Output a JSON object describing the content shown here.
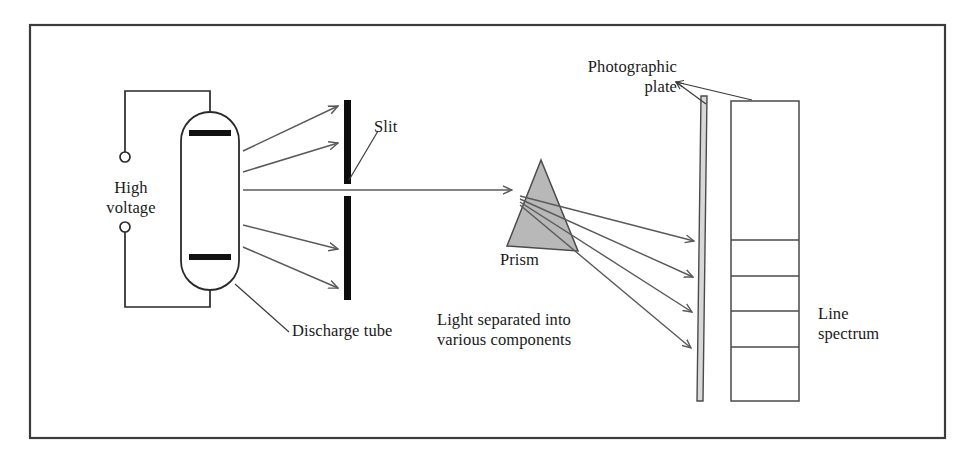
{
  "figure": {
    "background_color": "#ffffff",
    "border_color": "#3c3c3c",
    "ink_color": "#1a1a1a",
    "ray_color": "#5a5a5a",
    "prism_fill": "#b8b8b8",
    "prism_stroke": "#4a4a4a",
    "electrode_color": "#111111",
    "slit_color": "#0d0d0d",
    "border": {
      "x": 30,
      "y": 25,
      "width": 915,
      "height": 413
    }
  },
  "labels": {
    "high_voltage": "High\nvoltage",
    "discharge_tube": "Discharge tube",
    "slit": "Slit",
    "prism": "Prism",
    "light_separated": "Light separated into\nvarious components",
    "photographic_plate": "Photographic\nplate",
    "line_spectrum": "Line\nspectrum"
  },
  "components": {
    "discharge_tube": {
      "name": "discharge-tube",
      "x": 181,
      "y": 112,
      "width": 58,
      "height": 178,
      "corner_radius": 29,
      "electrodes": [
        {
          "name": "top-electrode",
          "y": 133,
          "x1": 189,
          "x2": 231
        },
        {
          "name": "bottom-electrode",
          "y": 257,
          "x1": 189,
          "x2": 231
        }
      ]
    },
    "circuit": {
      "name": "high-voltage-circuit",
      "top_wire": "M210,112 L210,91 L125,91 L125,152",
      "bottom_wire": "M210,290 L210,307 L125,307 L125,232",
      "terminals": [
        {
          "name": "terminal-top",
          "cx": 125,
          "cy": 157,
          "r": 5
        },
        {
          "name": "terminal-bottom",
          "cx": 125,
          "cy": 227,
          "r": 5
        }
      ]
    },
    "slit": {
      "name": "slit-barrier",
      "x": 344,
      "width": 7,
      "upper_segment": {
        "y1": 100,
        "y2": 184
      },
      "lower_segment": {
        "y1": 196,
        "y2": 300
      },
      "gap": {
        "y1": 184,
        "y2": 196
      }
    },
    "prism": {
      "name": "prism",
      "apex": [
        541,
        160
      ],
      "bottom_left": [
        507,
        246
      ],
      "bottom_right": [
        578,
        251
      ]
    },
    "photographic_plate": {
      "name": "photographic-plate",
      "top": [
        703,
        96
      ],
      "bottom": [
        699,
        401
      ],
      "width": 6
    },
    "line_spectrum": {
      "name": "line-spectrum-box",
      "x": 731,
      "y": 101,
      "width": 68,
      "height": 300,
      "line_positions_y": [
        240,
        276,
        311,
        347
      ]
    }
  },
  "rays": {
    "source_rays": [
      {
        "name": "ray-up-far",
        "x1": 243,
        "y1": 151,
        "x2": 340,
        "y2": 106
      },
      {
        "name": "ray-up-near",
        "x1": 243,
        "y1": 172,
        "x2": 340,
        "y2": 143
      },
      {
        "name": "ray-straight",
        "x1": 243,
        "y1": 190,
        "x2": 505,
        "y2": 190
      },
      {
        "name": "ray-down-near",
        "x1": 243,
        "y1": 225,
        "x2": 340,
        "y2": 249
      },
      {
        "name": "ray-down-far",
        "x1": 243,
        "y1": 247,
        "x2": 340,
        "y2": 288
      }
    ],
    "refracted_rays": [
      {
        "name": "refracted-ray-1",
        "x1": 520,
        "y1": 196,
        "x2": 697,
        "y2": 241
      },
      {
        "name": "refracted-ray-2",
        "x1": 520,
        "y1": 199,
        "x2": 697,
        "y2": 277
      },
      {
        "name": "refracted-ray-3",
        "x1": 520,
        "y1": 202,
        "x2": 697,
        "y2": 312
      },
      {
        "name": "refracted-ray-4",
        "x1": 520,
        "y1": 205,
        "x2": 697,
        "y2": 348
      }
    ]
  },
  "leaders": {
    "slit": "M378,131 L349,180",
    "discharge_tube": "M289,332 L235,284",
    "photographic_plate_to_plate": "M679,82 L706,103",
    "photographic_plate_to_box": "M679,82 L749,100"
  },
  "label_positions": {
    "high_voltage": {
      "left": 86,
      "top": 178,
      "width": 90
    },
    "discharge_tube": {
      "left": 292,
      "top": 321
    },
    "slit": {
      "left": 374,
      "top": 117
    },
    "prism": {
      "left": 500,
      "top": 250
    },
    "light_separated": {
      "left": 437,
      "top": 310
    },
    "photographic_plate": {
      "left": 529,
      "top": 57,
      "width": 148
    },
    "line_spectrum": {
      "left": 818,
      "top": 304
    }
  }
}
